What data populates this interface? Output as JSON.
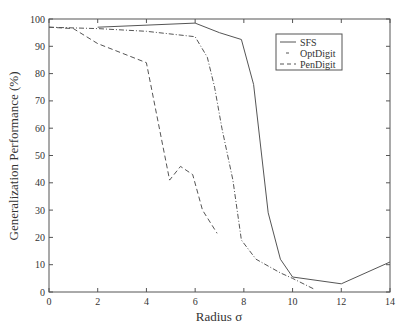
{
  "chart_data": {
    "type": "line",
    "title": "",
    "xlabel": "Radius σ",
    "ylabel": "Generalization Performance (%)",
    "xlim": [
      0,
      14
    ],
    "ylim": [
      0,
      100
    ],
    "xticks": [
      0,
      2,
      4,
      6,
      8,
      10,
      12,
      14
    ],
    "yticks": [
      0,
      10,
      20,
      30,
      40,
      50,
      60,
      70,
      80,
      90,
      100
    ],
    "grid": false,
    "legend_position": "upper right",
    "series": [
      {
        "name": "SFS",
        "style": "solid",
        "points": [
          [
            2,
            97
          ],
          [
            6,
            98.5
          ],
          [
            7,
            95
          ],
          [
            7.9,
            92.5
          ],
          [
            8.4,
            76
          ],
          [
            9,
            29
          ],
          [
            9.5,
            12
          ],
          [
            10,
            5.5
          ],
          [
            12,
            3
          ],
          [
            14,
            11
          ]
        ]
      },
      {
        "name": "OptDigit",
        "style": "dashdot",
        "points": [
          [
            0,
            97
          ],
          [
            2,
            96.5
          ],
          [
            4,
            95.5
          ],
          [
            6,
            93.5
          ],
          [
            6.5,
            86
          ],
          [
            6.8,
            75
          ],
          [
            7.1,
            60
          ],
          [
            7.55,
            41
          ],
          [
            7.9,
            19
          ],
          [
            8.5,
            12
          ],
          [
            9.5,
            7
          ],
          [
            10,
            5
          ],
          [
            10.9,
            1
          ]
        ]
      },
      {
        "name": "PenDigit",
        "style": "dashed",
        "points": [
          [
            0,
            97
          ],
          [
            1,
            96.5
          ],
          [
            2,
            91
          ],
          [
            4,
            84
          ],
          [
            4.95,
            41
          ],
          [
            5.4,
            46
          ],
          [
            5.9,
            43
          ],
          [
            6.3,
            30
          ],
          [
            6.9,
            21.5
          ]
        ]
      }
    ]
  }
}
